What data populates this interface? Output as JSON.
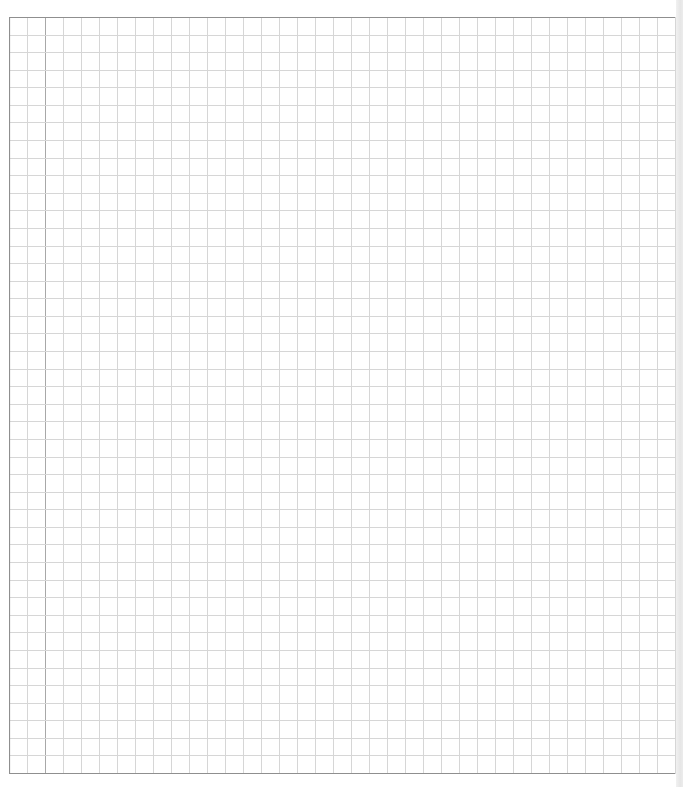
{
  "page": {
    "type": "graph-paper",
    "background": "#ffffff",
    "grid": {
      "columns": 37,
      "rows": 43,
      "line_color": "#d6d6d6",
      "border_color": "#8f8f8f",
      "margin_line_color": "#a8a8a8",
      "margin_column_index": 2
    }
  }
}
